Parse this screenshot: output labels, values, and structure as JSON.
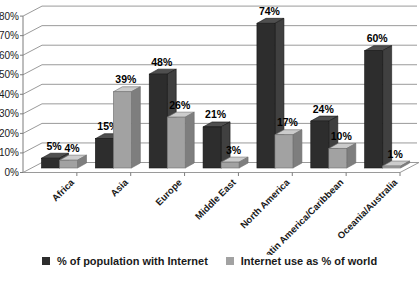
{
  "chart_data": {
    "type": "bar",
    "projection": "3d",
    "categories": [
      "Africa",
      "Asia",
      "Europe",
      "Middle East",
      "North America",
      "Latin America/Caribbean",
      "Oceania/Australia"
    ],
    "series": [
      {
        "name": "% of population with Internet",
        "values": [
          5,
          15,
          48,
          21,
          74,
          24,
          60
        ],
        "labels": [
          "5%",
          "15%",
          "48%",
          "21%",
          "74%",
          "24%",
          "60%"
        ],
        "color": "#2d2d2d",
        "top_color": "#4f4f4f",
        "side_color": "#404040",
        "edge_color": "#151515"
      },
      {
        "name": "Internet use as % of world",
        "values": [
          4,
          39,
          26,
          3,
          17,
          10,
          1
        ],
        "labels": [
          "4%",
          "39%",
          "26%",
          "3%",
          "17%",
          "10%",
          "1%"
        ],
        "color": "#a2a2a2",
        "top_color": "#cccccc",
        "side_color": "#7e7e7e",
        "edge_color": "#6f6f6f"
      }
    ],
    "ylim": [
      0,
      80
    ],
    "ytick_step": 10,
    "ytick_labels": [
      "0%",
      "10%",
      "20%",
      "30%",
      "40%",
      "50%",
      "60%",
      "70%",
      "80%"
    ],
    "grid": true,
    "gridline_color": "#9a9a9a",
    "axis_color": "#7d7d7d",
    "legend_position": "bottom"
  }
}
